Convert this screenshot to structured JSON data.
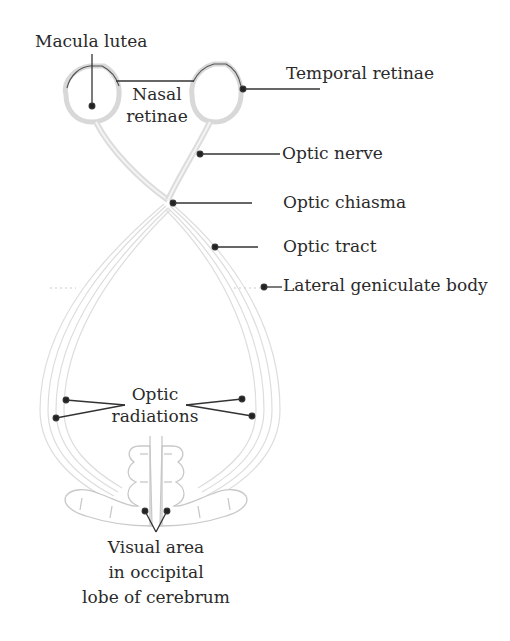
{
  "diagram": {
    "labels": {
      "macula_lutea": "Macula lutea",
      "nasal_retinae_line1": "Nasal",
      "nasal_retinae_line2": "retinae",
      "temporal_retinae": "Temporal retinae",
      "optic_nerve": "Optic nerve",
      "optic_chiasma": "Optic chiasma",
      "optic_tract": "Optic tract",
      "lateral_geniculate_body": "Lateral geniculate body",
      "optic_radiations_line1": "Optic",
      "optic_radiations_line2": "radiations",
      "visual_area_line1": "Visual area",
      "visual_area_line2": "in occipital",
      "visual_area_line3": "lobe of cerebrum"
    },
    "colors": {
      "text": "#2a2a2a",
      "leader": "#333333",
      "structure_fill": "#e6e6e6",
      "structure_stroke": "#c8c8c8",
      "eye_outline": "#555555"
    }
  }
}
